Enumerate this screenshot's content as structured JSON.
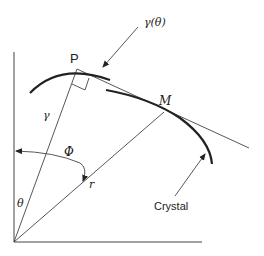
{
  "diagram": {
    "labels": {
      "P": "P",
      "M": "M",
      "gamma": "γ",
      "gamma_theta": "γ(θ)",
      "phi": "Φ",
      "theta": "θ",
      "r": "r",
      "crystal": "Crystal"
    },
    "colors": {
      "stroke": "#222222",
      "background": "#ffffff"
    }
  }
}
